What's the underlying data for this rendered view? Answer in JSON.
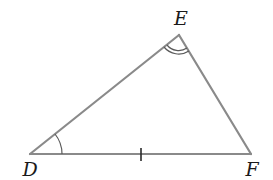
{
  "diagram": {
    "type": "triangle",
    "colors": {
      "stroke": "#8a8a8a",
      "label": "#1a1a1a",
      "background": "#ffffff"
    },
    "vertices": {
      "D": {
        "label": "D",
        "x": 30,
        "y": 154,
        "label_x": 30,
        "label_y": 175
      },
      "E": {
        "label": "E",
        "x": 179,
        "y": 35,
        "label_x": 181,
        "label_y": 25
      },
      "F": {
        "label": "F",
        "x": 251,
        "y": 154,
        "label_x": 252,
        "label_y": 175
      }
    },
    "sides": [
      {
        "name": "DE",
        "from": "D",
        "to": "E"
      },
      {
        "name": "EF",
        "from": "E",
        "to": "F"
      },
      {
        "name": "DF",
        "from": "D",
        "to": "F",
        "tick_marks": 1
      }
    ],
    "angle_marks": [
      {
        "vertex": "D",
        "arcs": 1
      },
      {
        "vertex": "E",
        "arcs": 2
      }
    ]
  }
}
